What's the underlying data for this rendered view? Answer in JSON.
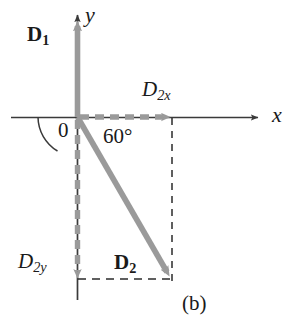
{
  "figure": {
    "caption": "(b)",
    "background_color": "#ffffff",
    "axis_color": "#3a3a3a",
    "vector_color": "#9a9a9a",
    "dashed_color": "#2b2b2b",
    "text_color": "#1a1a1a"
  },
  "axes": {
    "x_label": "x",
    "y_label": "y",
    "origin_label": "0"
  },
  "vectors": [
    {
      "id": "D1",
      "name_main": "D",
      "name_sub": "1",
      "style": "solid",
      "color": "#9a9a9a",
      "direction": "up",
      "from": [
        77,
        117
      ],
      "to": [
        77,
        20
      ]
    },
    {
      "id": "D2",
      "name_main": "D",
      "name_sub": "2",
      "style": "solid",
      "color": "#9a9a9a",
      "direction": "down-right",
      "from": [
        77,
        117
      ],
      "to": [
        171,
        280
      ]
    },
    {
      "id": "D2x",
      "name_main": "D",
      "name_sub": "2x",
      "style": "dashed",
      "color": "#9a9a9a",
      "direction": "right",
      "from": [
        77,
        117
      ],
      "to": [
        172,
        117
      ]
    },
    {
      "id": "D2y",
      "name_main": "D",
      "name_sub": "2y",
      "style": "dashed",
      "color": "#9a9a9a",
      "direction": "down",
      "from": [
        77,
        117
      ],
      "to": [
        77,
        279
      ]
    }
  ],
  "angle": {
    "value_label": "60°",
    "degrees": 60,
    "between": [
      "x-axis-positive",
      "D2"
    ],
    "arc_radius": 36
  },
  "construction_lines": [
    {
      "id": "vertical-projection",
      "from": [
        172,
        118
      ],
      "to": [
        172,
        281
      ],
      "style": "dashed",
      "color": "#2b2b2b"
    },
    {
      "id": "horizontal-projection",
      "from": [
        78,
        279
      ],
      "to": [
        172,
        279
      ],
      "style": "dashed",
      "color": "#2b2b2b"
    }
  ]
}
